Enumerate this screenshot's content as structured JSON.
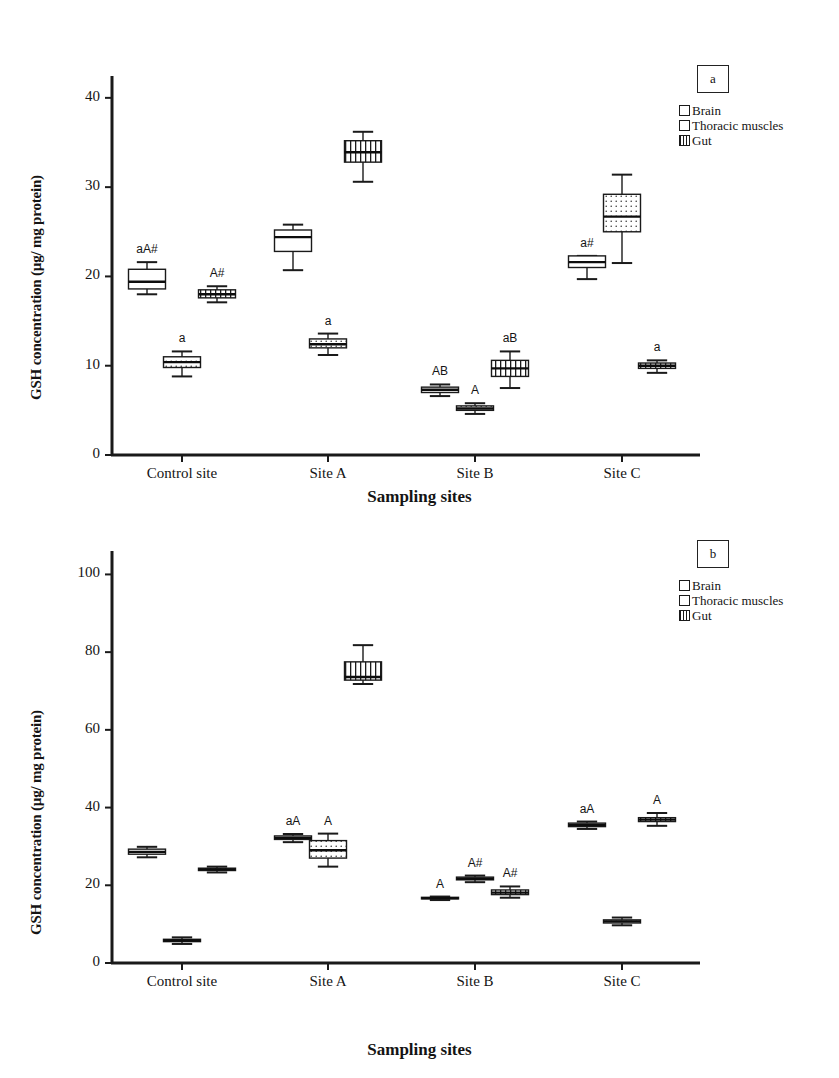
{
  "figure": {
    "panels": [
      {
        "tag": "a",
        "axis": {
          "ylabel": "GSH concentration (µg/ mg protein)",
          "xlabel": "Sampling sites",
          "yticks": [
            0,
            10,
            20,
            30,
            40
          ],
          "ylim": [
            0,
            42
          ],
          "categories": [
            "Control site",
            "Site A",
            "Site B",
            "Site C"
          ]
        },
        "legend": {
          "items": [
            {
              "label": "Brain",
              "pattern": "solid-white"
            },
            {
              "label": "Thoracic muscles",
              "pattern": "dotted"
            },
            {
              "label": "Gut",
              "pattern": "vertical-lines"
            }
          ]
        }
      },
      {
        "tag": "b",
        "axis": {
          "ylabel": "GSH concentration (µg/ mg protein)",
          "xlabel": "Sampling sites",
          "yticks": [
            0,
            20,
            40,
            60,
            80,
            100
          ],
          "ylim": [
            0,
            105
          ],
          "categories": [
            "Control site",
            "Site A",
            "Site B",
            "Site C"
          ]
        },
        "legend": {
          "items": [
            {
              "label": "Brain",
              "pattern": "solid-white"
            },
            {
              "label": "Thoracic muscles",
              "pattern": "dotted"
            },
            {
              "label": "Gut",
              "pattern": "vertical-lines"
            }
          ]
        }
      }
    ]
  },
  "chart_data": [
    {
      "type": "box",
      "panel": "a",
      "title": "",
      "xlabel": "Sampling sites",
      "ylabel": "GSH concentration (µg/ mg protein)",
      "ylim": [
        0,
        42
      ],
      "yticks": [
        0,
        10,
        20,
        30,
        40
      ],
      "categories": [
        "Control site",
        "Site A",
        "Site B",
        "Site C"
      ],
      "legend_position": "top-right",
      "grid": false,
      "series": [
        {
          "name": "Brain",
          "pattern": "solid-white",
          "boxes": [
            {
              "category": "Control site",
              "whisker_low": 18.0,
              "q1": 18.6,
              "median": 19.4,
              "q3": 20.8,
              "whisker_high": 21.6,
              "annotation": "aA#"
            },
            {
              "category": "Site A",
              "whisker_low": 20.7,
              "q1": 22.8,
              "median": 24.4,
              "q3": 25.2,
              "whisker_high": 25.8,
              "annotation": ""
            },
            {
              "category": "Site B",
              "whisker_low": 6.6,
              "q1": 7.0,
              "median": 7.3,
              "q3": 7.6,
              "whisker_high": 7.9,
              "annotation": "AB"
            },
            {
              "category": "Site C",
              "whisker_low": 19.7,
              "q1": 21.0,
              "median": 21.6,
              "q3": 22.3,
              "whisker_high": 22.3,
              "annotation": "a#"
            }
          ]
        },
        {
          "name": "Thoracic muscles",
          "pattern": "dotted",
          "boxes": [
            {
              "category": "Control site",
              "whisker_low": 8.8,
              "q1": 9.8,
              "median": 10.4,
              "q3": 11.0,
              "whisker_high": 11.6,
              "annotation": "a"
            },
            {
              "category": "Site A",
              "whisker_low": 11.2,
              "q1": 12.0,
              "median": 12.4,
              "q3": 13.0,
              "whisker_high": 13.6,
              "annotation": "a"
            },
            {
              "category": "Site B",
              "whisker_low": 4.6,
              "q1": 5.0,
              "median": 5.2,
              "q3": 5.5,
              "whisker_high": 5.8,
              "annotation": "A"
            },
            {
              "category": "Site C",
              "whisker_low": 21.5,
              "q1": 25.0,
              "median": 26.7,
              "q3": 29.2,
              "whisker_high": 31.4,
              "annotation": ""
            }
          ]
        },
        {
          "name": "Gut",
          "pattern": "vertical-lines",
          "boxes": [
            {
              "category": "Control site",
              "whisker_low": 17.1,
              "q1": 17.6,
              "median": 18.0,
              "q3": 18.5,
              "whisker_high": 18.9,
              "annotation": "A#"
            },
            {
              "category": "Site A",
              "whisker_low": 30.6,
              "q1": 32.8,
              "median": 33.9,
              "q3": 35.2,
              "whisker_high": 36.2,
              "annotation": ""
            },
            {
              "category": "Site B",
              "whisker_low": 7.5,
              "q1": 8.8,
              "median": 9.7,
              "q3": 10.6,
              "whisker_high": 11.6,
              "annotation": "aB"
            },
            {
              "category": "Site C",
              "whisker_low": 9.2,
              "q1": 9.7,
              "median": 10.0,
              "q3": 10.3,
              "whisker_high": 10.6,
              "annotation": "a"
            }
          ]
        }
      ]
    },
    {
      "type": "box",
      "panel": "b",
      "title": "",
      "xlabel": "Sampling sites",
      "ylabel": "GSH concentration (µg/ mg protein)",
      "ylim": [
        0,
        105
      ],
      "yticks": [
        0,
        20,
        40,
        60,
        80,
        100
      ],
      "categories": [
        "Control site",
        "Site A",
        "Site B",
        "Site C"
      ],
      "legend_position": "top-right",
      "grid": false,
      "series": [
        {
          "name": "Brain",
          "pattern": "solid-white",
          "boxes": [
            {
              "category": "Control site",
              "whisker_low": 27.2,
              "q1": 28.0,
              "median": 28.6,
              "q3": 29.3,
              "whisker_high": 29.9,
              "annotation": ""
            },
            {
              "category": "Site A",
              "whisker_low": 31.1,
              "q1": 31.8,
              "median": 32.2,
              "q3": 32.7,
              "whisker_high": 33.2,
              "annotation": "aA"
            },
            {
              "category": "Site B",
              "whisker_low": 16.2,
              "q1": 16.5,
              "median": 16.7,
              "q3": 16.9,
              "whisker_high": 17.1,
              "annotation": "A"
            },
            {
              "category": "Site C",
              "whisker_low": 34.5,
              "q1": 35.1,
              "median": 35.5,
              "q3": 36.0,
              "whisker_high": 36.4,
              "annotation": "aA"
            }
          ]
        },
        {
          "name": "Thoracic muscles",
          "pattern": "dotted",
          "boxes": [
            {
              "category": "Control site",
              "whisker_low": 4.9,
              "q1": 5.5,
              "median": 5.8,
              "q3": 6.1,
              "whisker_high": 6.6,
              "annotation": ""
            },
            {
              "category": "Site A",
              "whisker_low": 24.8,
              "q1": 27.0,
              "median": 29.0,
              "q3": 31.5,
              "whisker_high": 33.3,
              "annotation": "A"
            },
            {
              "category": "Site B",
              "whisker_low": 20.8,
              "q1": 21.4,
              "median": 21.7,
              "q3": 22.1,
              "whisker_high": 22.5,
              "annotation": "A#"
            },
            {
              "category": "Site C",
              "whisker_low": 9.7,
              "q1": 10.3,
              "median": 10.7,
              "q3": 11.1,
              "whisker_high": 11.7,
              "annotation": ""
            }
          ]
        },
        {
          "name": "Gut",
          "pattern": "vertical-lines",
          "boxes": [
            {
              "category": "Control site",
              "whisker_low": 23.3,
              "q1": 23.8,
              "median": 24.1,
              "q3": 24.4,
              "whisker_high": 24.8,
              "annotation": ""
            },
            {
              "category": "Site A",
              "whisker_low": 71.8,
              "q1": 72.8,
              "median": 73.6,
              "q3": 77.5,
              "whisker_high": 81.8,
              "annotation": ""
            },
            {
              "category": "Site B",
              "whisker_low": 16.8,
              "q1": 17.6,
              "median": 18.1,
              "q3": 18.8,
              "whisker_high": 19.7,
              "annotation": "A#"
            },
            {
              "category": "Site C",
              "whisker_low": 35.3,
              "q1": 36.4,
              "median": 36.9,
              "q3": 37.4,
              "whisker_high": 38.6,
              "annotation": "A"
            }
          ]
        }
      ]
    }
  ]
}
